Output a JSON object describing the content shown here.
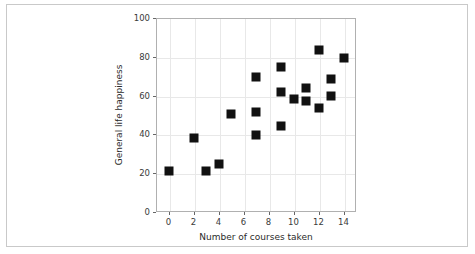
{
  "figure": {
    "background_color": "#ffffff",
    "card_border_color": "#c9c9c9",
    "axes_border_color": "#b0b0b0",
    "grid_color": "#e8e8e8",
    "marker_color": "#111111"
  },
  "chart_data": {
    "type": "scatter",
    "title": "",
    "xlabel": "Number of courses taken",
    "ylabel": "General life happiness",
    "xlim": [
      -1,
      15
    ],
    "ylim": [
      0,
      100
    ],
    "xticks": [
      0,
      2,
      4,
      6,
      8,
      10,
      12,
      14
    ],
    "xticklabels": [
      "0",
      "2",
      "4",
      "6",
      "8",
      "10",
      "12",
      "14"
    ],
    "yticks": [
      0,
      20,
      40,
      60,
      80,
      100
    ],
    "yticklabels": [
      "0",
      "20",
      "40",
      "60",
      "80",
      "100"
    ],
    "grid": true,
    "legend": null,
    "marker": "square",
    "marker_size": 9,
    "x": [
      0,
      2,
      3,
      4,
      5,
      7,
      7,
      7,
      9,
      9,
      9,
      10,
      11,
      11,
      12,
      12,
      13,
      13,
      14
    ],
    "y": [
      21,
      38,
      21,
      25,
      50.5,
      69.5,
      51.5,
      39.5,
      74.5,
      62,
      44.5,
      58,
      64,
      57,
      83.5,
      53.5,
      68.5,
      60,
      79.5
    ],
    "points": [
      {
        "x": 0,
        "y": 21
      },
      {
        "x": 2,
        "y": 38
      },
      {
        "x": 3,
        "y": 21
      },
      {
        "x": 4,
        "y": 25
      },
      {
        "x": 5,
        "y": 50.5
      },
      {
        "x": 7,
        "y": 69.5
      },
      {
        "x": 7,
        "y": 51.5
      },
      {
        "x": 7,
        "y": 39.5
      },
      {
        "x": 9,
        "y": 74.5
      },
      {
        "x": 9,
        "y": 62
      },
      {
        "x": 9,
        "y": 44.5
      },
      {
        "x": 10,
        "y": 58
      },
      {
        "x": 11,
        "y": 64
      },
      {
        "x": 11,
        "y": 57
      },
      {
        "x": 12,
        "y": 83.5
      },
      {
        "x": 12,
        "y": 53.5
      },
      {
        "x": 13,
        "y": 68.5
      },
      {
        "x": 13,
        "y": 60
      },
      {
        "x": 14,
        "y": 79.5
      }
    ]
  }
}
